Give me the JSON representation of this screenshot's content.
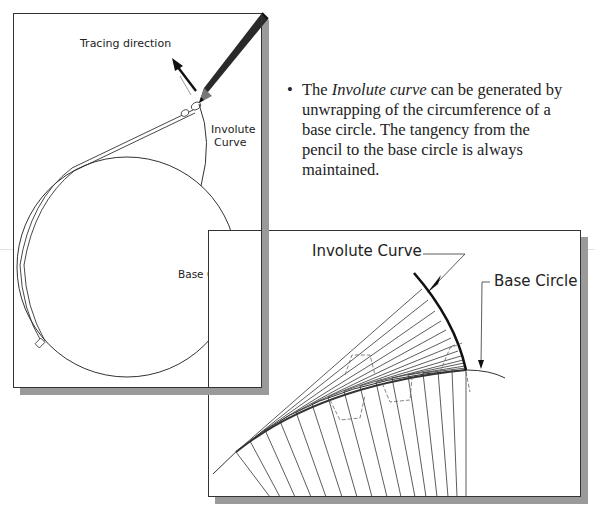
{
  "left_figure": {
    "tracing_label": "Tracing direction",
    "involute_label_line1": "Involute",
    "involute_label_line2": "Curve",
    "base_circle_label": "Base Circle"
  },
  "description": {
    "bullet": "•",
    "text_before": "The ",
    "text_italic": "Involute curve",
    "text_after": " can be generated by unwrapping of the circumference of a base circle. The tangency from the pencil to the base circle is always maintained."
  },
  "right_figure": {
    "involute_label": "Involute Curve",
    "base_circle_label": "Base Circle"
  },
  "colors": {
    "line": "#333333",
    "shadow": "#9a9a9a",
    "pencil_dark": "#2a2a2a"
  }
}
